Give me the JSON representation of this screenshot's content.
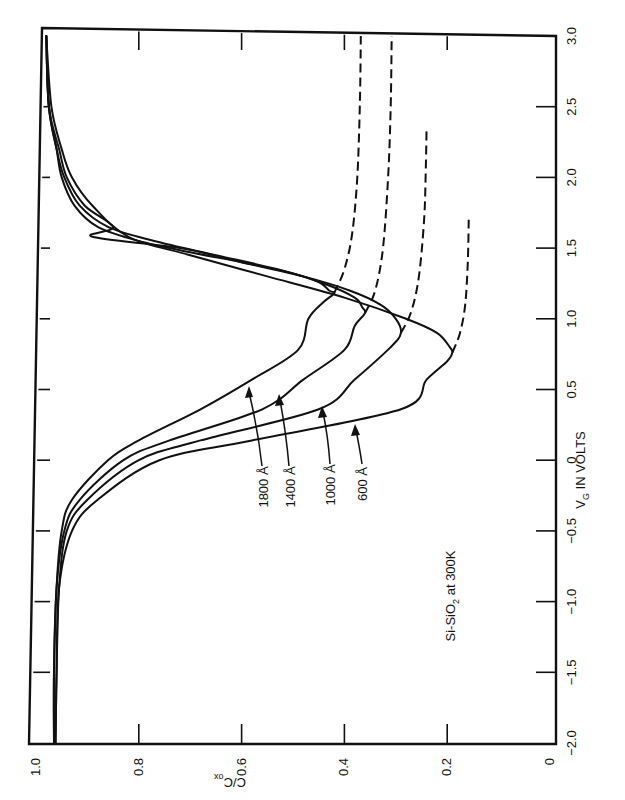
{
  "chart_data": {
    "type": "line",
    "orientation": "rotated 90deg clockwise (V_G axis vertical on right, C/Cox axis horizontal along bottom)",
    "title": "",
    "xlabel": "V_G IN VOLTS",
    "ylabel": "C/C_ox",
    "xlim": [
      -2.0,
      3.0
    ],
    "ylim": [
      0,
      1.0
    ],
    "x_ticks": [
      "-2.0",
      "-1.5",
      "-1.0",
      "-0.5",
      "0",
      "0.5",
      "1.0",
      "1.5",
      "2.0",
      "2.5",
      "3.0"
    ],
    "x_tick_values": [
      -2.0,
      -1.5,
      -1.0,
      -0.5,
      0,
      0.5,
      1.0,
      1.5,
      2.0,
      2.5,
      3.0
    ],
    "y_ticks": [
      "0",
      "0.2",
      "0.4",
      "0.6",
      "0.8",
      "1.0"
    ],
    "y_tick_values": [
      0,
      0.2,
      0.4,
      0.6,
      0.8,
      1.0
    ],
    "grid": false,
    "annotation": "Si-SiO2 at 300K",
    "series": [
      {
        "name": "1800 Å",
        "label": "1800 Å",
        "solid": [
          [
            3.0,
            0.98
          ],
          [
            2.5,
            0.975
          ],
          [
            2.2,
            0.96
          ],
          [
            2.0,
            0.95
          ],
          [
            1.8,
            0.925
          ],
          [
            1.65,
            0.88
          ],
          [
            1.55,
            0.8
          ],
          [
            1.47,
            0.7
          ],
          [
            1.4,
            0.6
          ],
          [
            1.33,
            0.51
          ],
          [
            1.26,
            0.45
          ],
          [
            1.2,
            0.43
          ],
          [
            1.18,
            0.42
          ],
          [
            1.12,
            0.44
          ],
          [
            1.0,
            0.47
          ],
          [
            0.78,
            0.49
          ],
          [
            0.57,
            0.58
          ],
          [
            0.36,
            0.68
          ],
          [
            0.14,
            0.8
          ],
          [
            0.0,
            0.86
          ],
          [
            -0.28,
            0.93
          ],
          [
            -0.5,
            0.95
          ],
          [
            -0.9,
            0.96
          ],
          [
            -1.5,
            0.965
          ],
          [
            -2.0,
            0.965
          ]
        ],
        "dashed": [
          [
            1.18,
            0.42
          ],
          [
            1.35,
            0.4
          ],
          [
            1.6,
            0.385
          ],
          [
            2.0,
            0.375
          ],
          [
            2.5,
            0.37
          ],
          [
            3.0,
            0.368
          ]
        ]
      },
      {
        "name": "1400 Å",
        "label": "1400 Å",
        "solid": [
          [
            3.0,
            0.98
          ],
          [
            2.5,
            0.975
          ],
          [
            2.2,
            0.96
          ],
          [
            2.0,
            0.945
          ],
          [
            1.8,
            0.915
          ],
          [
            1.65,
            0.86
          ],
          [
            1.55,
            0.77
          ],
          [
            1.45,
            0.65
          ],
          [
            1.35,
            0.53
          ],
          [
            1.25,
            0.44
          ],
          [
            1.15,
            0.38
          ],
          [
            1.08,
            0.365
          ],
          [
            1.04,
            0.36
          ],
          [
            0.95,
            0.38
          ],
          [
            0.78,
            0.4
          ],
          [
            0.57,
            0.48
          ],
          [
            0.36,
            0.56
          ],
          [
            0.14,
            0.74
          ],
          [
            0.0,
            0.83
          ],
          [
            -0.28,
            0.915
          ],
          [
            -0.5,
            0.945
          ],
          [
            -0.9,
            0.96
          ],
          [
            -1.5,
            0.965
          ],
          [
            -2.0,
            0.965
          ]
        ],
        "dashed": [
          [
            1.04,
            0.36
          ],
          [
            1.2,
            0.34
          ],
          [
            1.5,
            0.325
          ],
          [
            2.0,
            0.315
          ],
          [
            2.5,
            0.31
          ],
          [
            3.0,
            0.308
          ]
        ]
      },
      {
        "name": "1000 Å",
        "label": "1000 Å",
        "solid": [
          [
            3.0,
            0.98
          ],
          [
            2.5,
            0.975
          ],
          [
            2.2,
            0.955
          ],
          [
            2.0,
            0.94
          ],
          [
            1.8,
            0.905
          ],
          [
            1.65,
            0.85
          ],
          [
            1.58,
            0.89
          ],
          [
            1.5,
            0.72
          ],
          [
            1.4,
            0.6
          ],
          [
            1.3,
            0.48
          ],
          [
            1.2,
            0.39
          ],
          [
            1.1,
            0.33
          ],
          [
            1.0,
            0.3
          ],
          [
            0.9,
            0.29
          ],
          [
            0.8,
            0.31
          ],
          [
            0.57,
            0.38
          ],
          [
            0.36,
            0.45
          ],
          [
            0.14,
            0.68
          ],
          [
            0.0,
            0.8
          ],
          [
            -0.28,
            0.9
          ],
          [
            -0.5,
            0.94
          ],
          [
            -0.9,
            0.955
          ],
          [
            -1.5,
            0.96
          ],
          [
            -2.0,
            0.962
          ]
        ],
        "dashed": [
          [
            0.9,
            0.29
          ],
          [
            1.05,
            0.27
          ],
          [
            1.3,
            0.255
          ],
          [
            1.7,
            0.245
          ],
          [
            2.0,
            0.242
          ],
          [
            2.36,
            0.24
          ]
        ]
      },
      {
        "name": "600 Å",
        "label": "600 Å",
        "solid": [
          [
            3.0,
            0.98
          ],
          [
            2.5,
            0.97
          ],
          [
            2.2,
            0.95
          ],
          [
            2.0,
            0.93
          ],
          [
            1.8,
            0.89
          ],
          [
            1.58,
            0.82
          ],
          [
            1.45,
            0.7
          ],
          [
            1.3,
            0.55
          ],
          [
            1.15,
            0.4
          ],
          [
            1.0,
            0.28
          ],
          [
            0.9,
            0.22
          ],
          [
            0.8,
            0.195
          ],
          [
            0.76,
            0.19
          ],
          [
            0.7,
            0.2
          ],
          [
            0.57,
            0.24
          ],
          [
            0.36,
            0.29
          ],
          [
            0.14,
            0.58
          ],
          [
            0.0,
            0.76
          ],
          [
            -0.28,
            0.88
          ],
          [
            -0.5,
            0.93
          ],
          [
            -0.9,
            0.955
          ],
          [
            -1.5,
            0.96
          ],
          [
            -2.0,
            0.962
          ]
        ],
        "dashed": [
          [
            0.76,
            0.19
          ],
          [
            0.9,
            0.175
          ],
          [
            1.1,
            0.165
          ],
          [
            1.4,
            0.16
          ],
          [
            1.72,
            0.158
          ]
        ]
      }
    ]
  },
  "axes": {
    "x_title_main": "V",
    "x_title_sub": "G",
    "x_title_rest": " IN VOLTS",
    "y_title_main": "C/C",
    "y_title_sub": "ox"
  },
  "annotation": {
    "main": "Si-SiO",
    "sub": "2",
    "rest": " at 300K"
  },
  "labels": {
    "l1800": "1800 Å",
    "l1400": "1400 Å",
    "l1000": "1000 Å",
    "l600": "600 Å"
  }
}
